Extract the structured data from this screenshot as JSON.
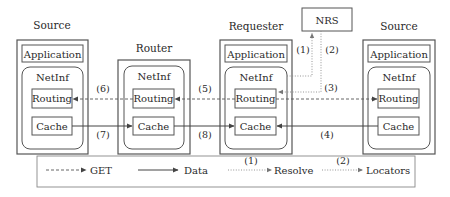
{
  "nodes": {
    "source_left": {
      "title": "Source",
      "application": "Application",
      "netinf": "NetInf",
      "routing": "Routing",
      "cache": "Cache"
    },
    "router": {
      "title": "Router",
      "netinf": "NetInf",
      "routing": "Routing",
      "cache": "Cache"
    },
    "requester": {
      "title": "Requester",
      "application": "Application",
      "netinf": "NetInf",
      "routing": "Routing",
      "cache": "Cache"
    },
    "source_right": {
      "title": "Source",
      "application": "Application",
      "netinf": "NetInf",
      "routing": "Routing",
      "cache": "Cache"
    },
    "nrs": {
      "title": "NRS"
    }
  },
  "steps": {
    "s1": "(1)",
    "s2": "(2)",
    "s3": "(3)",
    "s4": "(4)",
    "s5": "(5)",
    "s6": "(6)",
    "s7": "(7)",
    "s8": "(8)"
  },
  "legend": {
    "get": "GET",
    "data": "Data",
    "resolve_step": "(1)",
    "resolve": "Resolve",
    "locators_step": "(2)",
    "locators": "Locators"
  },
  "colors": {
    "line": "#555555",
    "text": "#2a2a2a",
    "dotted": "#8a8a8a"
  }
}
